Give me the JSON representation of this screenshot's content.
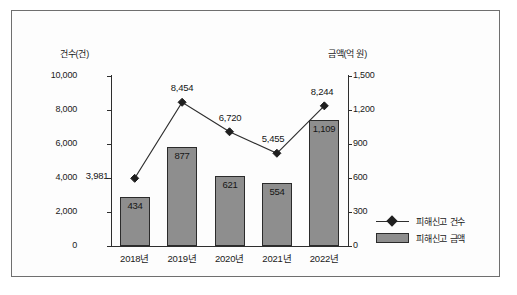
{
  "chart_data": {
    "type": "bar",
    "title": "",
    "subtitle": "",
    "categories": [
      "2018년",
      "2019년",
      "2020년",
      "2021년",
      "2022년"
    ],
    "xlabel": "",
    "ylabel": "건수(건)",
    "y2label": "금액(억 원)",
    "ylim": [
      0,
      10000
    ],
    "y2lim": [
      0,
      1500
    ],
    "grid": false,
    "legend_position": "right-bottom",
    "y_ticks": [
      "0",
      "2,000",
      "4,000",
      "6,000",
      "8,000",
      "10,000"
    ],
    "y_tick_values": [
      0,
      2000,
      4000,
      6000,
      8000,
      10000
    ],
    "y2_ticks": [
      "0",
      "300",
      "600",
      "900",
      "1,200",
      "1,500"
    ],
    "y2_tick_values": [
      0,
      300,
      600,
      900,
      1200,
      1500
    ],
    "series": [
      {
        "name": "피해신고 건수",
        "type": "line",
        "axis": "left",
        "marker": "diamond",
        "values": [
          3981,
          8454,
          6720,
          5455,
          8244
        ],
        "labels": [
          "3,981",
          "8,454",
          "6,720",
          "5,455",
          "8,244"
        ]
      },
      {
        "name": "피해신고 금액",
        "type": "bar",
        "axis": "right",
        "color": "#8e8e8e",
        "values": [
          434,
          877,
          621,
          554,
          1109
        ],
        "labels": [
          "434",
          "877",
          "621",
          "554",
          "1,109"
        ]
      }
    ]
  },
  "legend": {
    "items": [
      {
        "label": "피해신고 건수",
        "marker": "line-diamond"
      },
      {
        "label": "피해신고 금액",
        "marker": "filled-rect"
      }
    ]
  }
}
